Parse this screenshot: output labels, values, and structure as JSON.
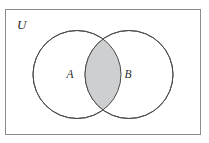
{
  "figure": {
    "type": "venn-diagram",
    "caption_alt": "Venn diagram of two overlapping sets A and B inside universal set U, with the intersection shaded",
    "background_color": "#ffffff"
  },
  "universe": {
    "label": "U",
    "name": "universal-set",
    "frame": {
      "x": 5,
      "y": 9,
      "width": 195,
      "height": 125,
      "stroke_color": "#8d8d8d",
      "stroke_width": 1,
      "fill_color": "#ffffff"
    }
  },
  "sets": [
    {
      "label": "A",
      "name": "set-a",
      "cx": 77,
      "cy": 74.5,
      "r": 44,
      "stroke_color": "#4a4a4a",
      "fill_color": "#ffffff",
      "label_x": 70,
      "label_y": 78
    },
    {
      "label": "B",
      "name": "set-b",
      "cx": 129,
      "cy": 74.5,
      "r": 44,
      "stroke_color": "#4a4a4a",
      "fill_color": "#ffffff",
      "label_x": 128,
      "label_y": 78
    }
  ],
  "intersection": {
    "label": "",
    "name": "set-intersection-a-and-b",
    "shaded": true,
    "fill_color": "#cdcfd0",
    "stroke_color": "#4a4a4a"
  },
  "colors": {
    "outline": "#4a4a4a",
    "frame": "#8d8d8d",
    "shade": "#cdcfd0",
    "text": "#2b2b2b",
    "background": "#ffffff"
  }
}
